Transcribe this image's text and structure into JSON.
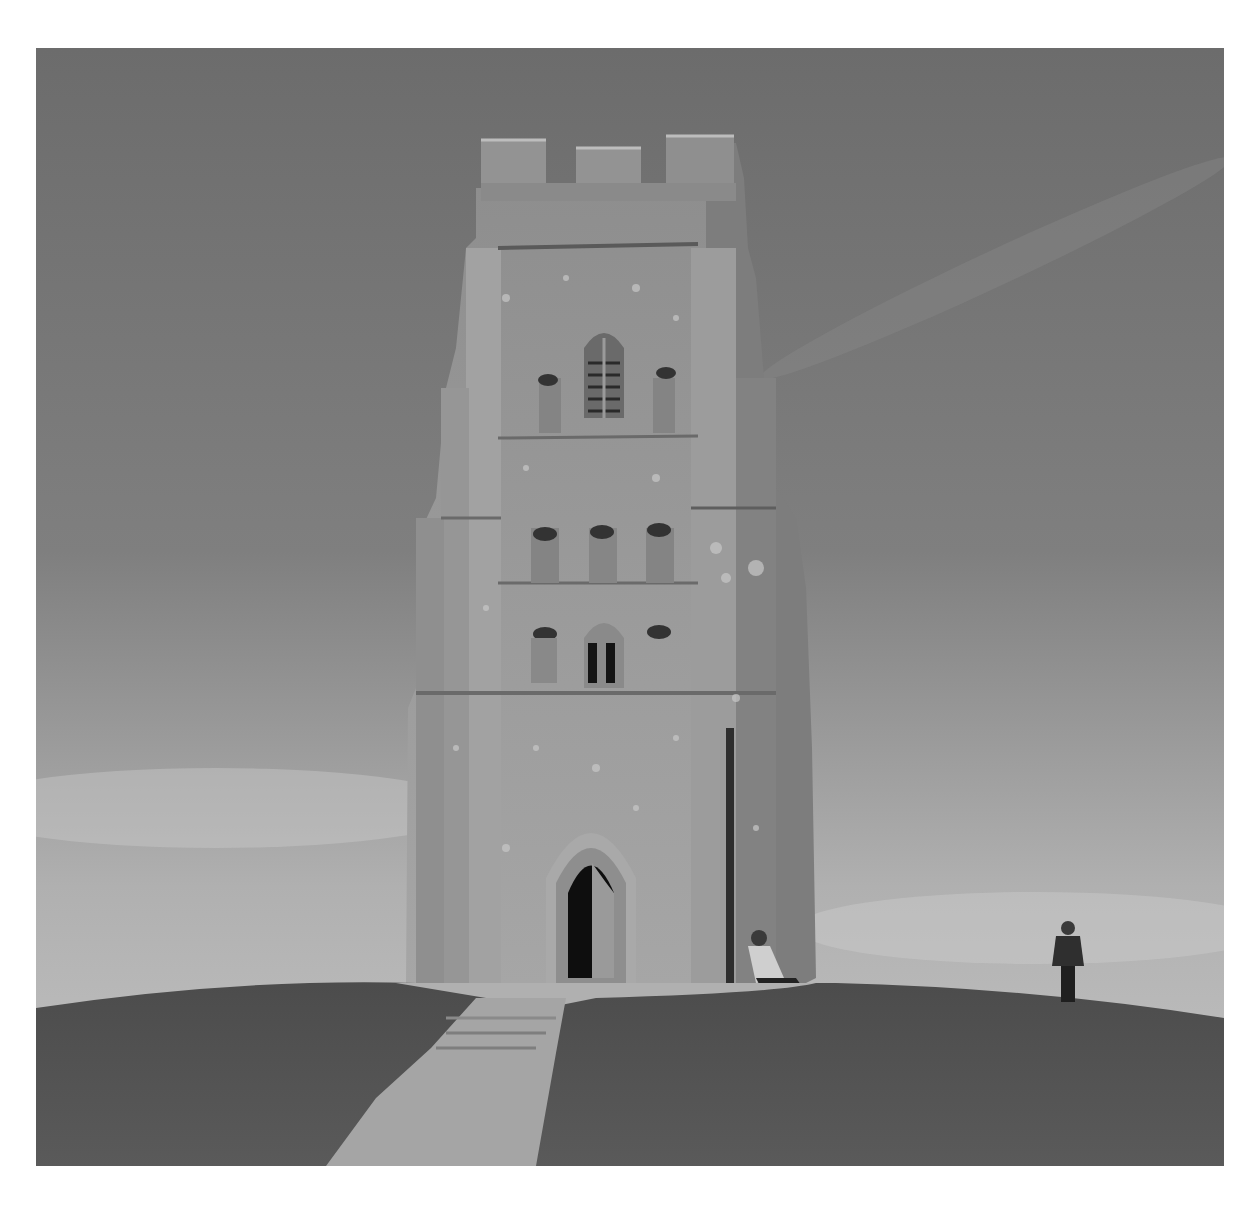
{
  "image": {
    "alt": "Black-and-white photograph of a medieval stone church tower standing on a grassy hilltop, with a paved path leading up to its pointed-arch doorway and two people nearby",
    "style": "monochrome",
    "colors": {
      "background": "#ffffff",
      "sky_top": "#6e6e6e",
      "sky_bottom": "#b9b9b9",
      "stone": "#9a9a9a",
      "stone_light": "#b4b4b4",
      "stone_shadow": "#7c7c7c",
      "grass": "#555555",
      "path": "#a8a8a8",
      "opening": "#111111"
    },
    "subjects": [
      {
        "name": "tower",
        "description": "tall square stone tower with crenellated parapet, buttresses, Gothic louvered window, niches and arched doorway"
      },
      {
        "name": "person-seated",
        "description": "person seated at the base of the tower, right of the doorway"
      },
      {
        "name": "person-standing",
        "description": "person standing on the hill to the right, facing away"
      },
      {
        "name": "path",
        "description": "paved footpath with steps leading from the foreground to the tower door"
      },
      {
        "name": "hill",
        "description": "rounded grassy hilltop"
      }
    ]
  }
}
